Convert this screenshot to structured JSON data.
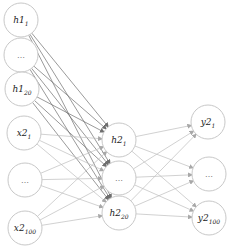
{
  "diagram": {
    "type": "neural-network",
    "layers": [
      {
        "name": "input",
        "nodes": [
          {
            "id": "h1_1",
            "base": "h1",
            "sub": "1",
            "cx": 21,
            "cy": 20
          },
          {
            "id": "h1_mid",
            "base": "...",
            "sub": "",
            "cx": 21,
            "cy": 55
          },
          {
            "id": "h1_20",
            "base": "h1",
            "sub": "20",
            "cx": 22,
            "cy": 89
          },
          {
            "id": "x2_1",
            "base": "x2",
            "sub": "1",
            "cx": 24,
            "cy": 133
          },
          {
            "id": "x2_mid",
            "base": "...",
            "sub": "",
            "cx": 25,
            "cy": 180
          },
          {
            "id": "x2_100",
            "base": "x2",
            "sub": "100",
            "cx": 25,
            "cy": 228
          }
        ]
      },
      {
        "name": "hidden",
        "nodes": [
          {
            "id": "h2_1",
            "base": "h2",
            "sub": "1",
            "cx": 119,
            "cy": 140
          },
          {
            "id": "h2_mid",
            "base": "...",
            "sub": "",
            "cx": 119,
            "cy": 178
          },
          {
            "id": "h2_20",
            "base": "h2",
            "sub": "20",
            "cx": 119,
            "cy": 213
          }
        ]
      },
      {
        "name": "output",
        "nodes": [
          {
            "id": "y2_1",
            "base": "y2",
            "sub": "1",
            "cx": 208,
            "cy": 122
          },
          {
            "id": "y2_mid",
            "base": "...",
            "sub": "",
            "cx": 209,
            "cy": 174
          },
          {
            "id": "y2_100",
            "base": "y2",
            "sub": "100",
            "cx": 209,
            "cy": 218
          }
        ]
      }
    ],
    "radius": 17,
    "colors": {
      "node_stroke": "#c8c8c8",
      "edge_h1": "#6e6e6e",
      "edge_other": "#bdbdbd"
    }
  }
}
